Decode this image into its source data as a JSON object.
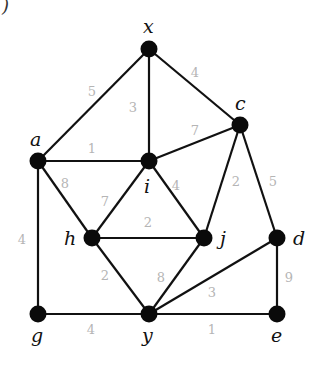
{
  "diagram": {
    "type": "weighted-undirected-graph",
    "corner_fragment": ")",
    "nodes": [
      {
        "id": "x",
        "label": "x",
        "cx": 149,
        "cy": 49,
        "lx": 143,
        "ly": 33
      },
      {
        "id": "a",
        "label": "a",
        "cx": 38,
        "cy": 161,
        "lx": 30,
        "ly": 146
      },
      {
        "id": "c",
        "label": "c",
        "cx": 240,
        "cy": 125,
        "lx": 235,
        "ly": 110
      },
      {
        "id": "i",
        "label": "i",
        "cx": 149,
        "cy": 161,
        "lx": 144,
        "ly": 193
      },
      {
        "id": "h",
        "label": "h",
        "cx": 92,
        "cy": 238,
        "lx": 64,
        "ly": 245
      },
      {
        "id": "j",
        "label": "j",
        "cx": 204,
        "cy": 238,
        "lx": 220,
        "ly": 245
      },
      {
        "id": "d",
        "label": "d",
        "cx": 277,
        "cy": 238,
        "lx": 293,
        "ly": 245
      },
      {
        "id": "g",
        "label": "g",
        "cx": 38,
        "cy": 314,
        "lx": 31,
        "ly": 342
      },
      {
        "id": "y",
        "label": "y",
        "cx": 149,
        "cy": 314,
        "lx": 142,
        "ly": 342
      },
      {
        "id": "e",
        "label": "e",
        "cx": 277,
        "cy": 314,
        "lx": 271,
        "ly": 342
      }
    ],
    "edges": [
      {
        "from": "a",
        "to": "x",
        "weight": "5",
        "wx": 92,
        "wy": 96
      },
      {
        "from": "x",
        "to": "i",
        "weight": "3",
        "wx": 133,
        "wy": 112
      },
      {
        "from": "x",
        "to": "c",
        "weight": "4",
        "wx": 195,
        "wy": 77
      },
      {
        "from": "a",
        "to": "i",
        "weight": "1",
        "wx": 92,
        "wy": 153
      },
      {
        "from": "i",
        "to": "c",
        "weight": "7",
        "wx": 195,
        "wy": 135
      },
      {
        "from": "a",
        "to": "h",
        "weight": "8",
        "wx": 65,
        "wy": 188
      },
      {
        "from": "a",
        "to": "g",
        "weight": "4",
        "wx": 22,
        "wy": 244
      },
      {
        "from": "i",
        "to": "h",
        "weight": "7",
        "wx": 105,
        "wy": 206
      },
      {
        "from": "i",
        "to": "j",
        "weight": "4",
        "wx": 176,
        "wy": 190
      },
      {
        "from": "c",
        "to": "j",
        "weight": "2",
        "wx": 236,
        "wy": 186
      },
      {
        "from": "c",
        "to": "d",
        "weight": "5",
        "wx": 273,
        "wy": 186
      },
      {
        "from": "h",
        "to": "j",
        "weight": "2",
        "wx": 148,
        "wy": 227
      },
      {
        "from": "h",
        "to": "y",
        "weight": "2",
        "wx": 105,
        "wy": 280
      },
      {
        "from": "j",
        "to": "y",
        "weight": "8",
        "wx": 161,
        "wy": 282
      },
      {
        "from": "y",
        "to": "d",
        "weight": "3",
        "wx": 212,
        "wy": 297
      },
      {
        "from": "d",
        "to": "e",
        "weight": "9",
        "wx": 289,
        "wy": 282
      },
      {
        "from": "g",
        "to": "y",
        "weight": "4",
        "wx": 91,
        "wy": 334
      },
      {
        "from": "y",
        "to": "e",
        "weight": "1",
        "wx": 212,
        "wy": 334
      }
    ]
  }
}
